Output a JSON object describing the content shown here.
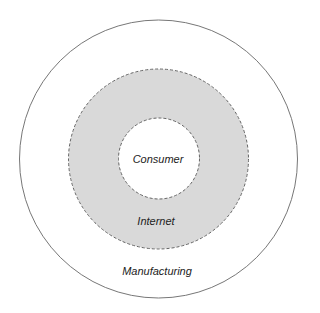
{
  "diagram": {
    "type": "concentric-circles",
    "colors": {
      "outer_stroke": "#777777",
      "middle_fill": "#d9d9d9",
      "dash_stroke": "#666666",
      "background": "#ffffff"
    },
    "rings": [
      {
        "id": "inner",
        "label": "Consumer"
      },
      {
        "id": "middle",
        "label": "Internet"
      },
      {
        "id": "outer",
        "label": "Manufacturing"
      }
    ]
  }
}
